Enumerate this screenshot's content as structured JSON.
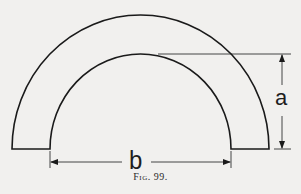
{
  "figure": {
    "caption": "Fig. 99.",
    "labels": {
      "height_dimension": "a",
      "width_dimension": "b"
    },
    "shape": "semicircular arch ring",
    "colors": {
      "line": "#1a1a1a",
      "background": "#f1f0ee"
    }
  }
}
